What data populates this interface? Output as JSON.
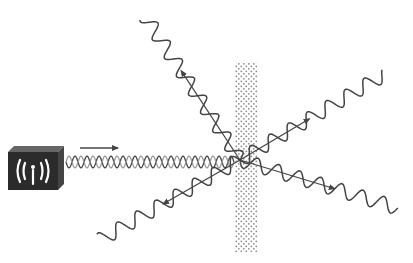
{
  "diagram": {
    "title": "",
    "source": {
      "icon": "radio-transmitter-icon",
      "label": ""
    },
    "incident_wave": {
      "kind": "double-helix",
      "direction": "right"
    },
    "barrier": {
      "pattern": "stippled"
    },
    "scattered_rays": [
      {
        "name": "ray-upper-left",
        "direction": "upper-left"
      },
      {
        "name": "ray-upper-right",
        "direction": "upper-right"
      },
      {
        "name": "ray-lower-right",
        "direction": "lower-right"
      },
      {
        "name": "ray-lower-left",
        "direction": "lower-left"
      }
    ],
    "colors": {
      "ink": "#444444",
      "box": "#2b2b2b",
      "box_top": "#555555",
      "barrier_dot": "#8a8a8a",
      "helix_light": "#9a9a9a"
    }
  }
}
